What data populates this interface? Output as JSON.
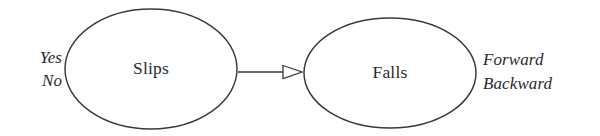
{
  "diagram": {
    "type": "causal-network",
    "background_color": "#ffffff",
    "stroke_color": "#3a3a3c",
    "text_color": "#2b2b2d",
    "nodes": [
      {
        "id": "slips",
        "label": "Slips",
        "shape": "ellipse",
        "cx": 151,
        "cy": 69,
        "rx": 86,
        "ry": 60,
        "states": [
          "Yes",
          "No"
        ],
        "states_position": "left"
      },
      {
        "id": "falls",
        "label": "Falls",
        "shape": "ellipse",
        "cx": 390,
        "cy": 73,
        "rx": 86,
        "ry": 55,
        "states": [
          "Forward",
          "Backward"
        ],
        "states_position": "right"
      }
    ],
    "edges": [
      {
        "id": "slips-to-falls",
        "from": "slips",
        "to": "falls",
        "label": "",
        "arrowhead": "open-triangle",
        "x1": 238,
        "y1": 72,
        "x2": 303,
        "y2": 72
      }
    ],
    "state_labels": {
      "slips_yes": "Yes",
      "slips_no": "No",
      "falls_forward": "Forward",
      "falls_backward": "Backward"
    }
  }
}
